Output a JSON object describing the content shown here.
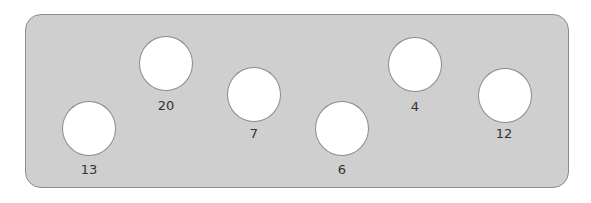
{
  "panel": {
    "fill": "#cfcfcf",
    "border": "#8c8c8c"
  },
  "holes": [
    {
      "label": "13",
      "cx": 89,
      "cy": 129,
      "label_y": 170
    },
    {
      "label": "20",
      "cx": 166,
      "cy": 63,
      "label_y": 106
    },
    {
      "label": "7",
      "cx": 254,
      "cy": 94,
      "label_y": 134
    },
    {
      "label": "6",
      "cx": 342,
      "cy": 129,
      "label_y": 170
    },
    {
      "label": "4",
      "cx": 415,
      "cy": 64,
      "label_y": 107
    },
    {
      "label": "12",
      "cx": 505,
      "cy": 95,
      "label_y": 134
    }
  ]
}
